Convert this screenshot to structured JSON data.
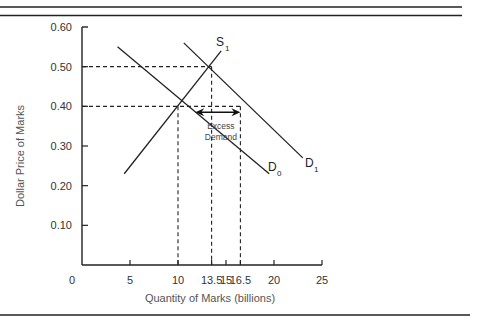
{
  "chart_data": {
    "type": "line",
    "title": "",
    "xlabel": "Quantity of Marks (billions)",
    "ylabel": "Dollar Price of Marks",
    "xlim": [
      0,
      25
    ],
    "ylim": [
      0,
      0.6
    ],
    "x_ticks": [
      "0",
      "5",
      "10",
      "13.5",
      "15",
      "16.5",
      "20",
      "25"
    ],
    "y_ticks": [
      "0.60",
      "0.50",
      "0.40",
      "0.30",
      "0.20",
      "0.10"
    ],
    "grid": false,
    "series": [
      {
        "name": "D0",
        "label_main": "D",
        "label_sub": "0",
        "kind": "demand",
        "points": [
          [
            3.7,
            0.55
          ],
          [
            19.5,
            0.23
          ]
        ]
      },
      {
        "name": "D1",
        "label_main": "D",
        "label_sub": "1",
        "kind": "demand",
        "points": [
          [
            10.6,
            0.56
          ],
          [
            23.0,
            0.27
          ]
        ]
      },
      {
        "name": "S1",
        "label_main": "S",
        "label_sub": "1",
        "kind": "supply",
        "points": [
          [
            4.4,
            0.23
          ],
          [
            14.5,
            0.54
          ]
        ]
      }
    ],
    "reference_lines": [
      {
        "type": "horizontal",
        "y": 0.5,
        "x_to": 13.5,
        "style": "dashed"
      },
      {
        "type": "horizontal",
        "y": 0.4,
        "x_to": 16.5,
        "style": "dashed"
      },
      {
        "type": "vertical",
        "x": 10,
        "y_to": 0.4,
        "style": "dashed"
      },
      {
        "type": "vertical",
        "x": 13.5,
        "y_to": 0.5,
        "style": "dashed"
      },
      {
        "type": "vertical",
        "x": 16.5,
        "y_to": 0.4,
        "style": "dashed"
      }
    ],
    "equilibria": [
      {
        "name": "initial",
        "x": 10,
        "y": 0.4
      },
      {
        "name": "new",
        "x": 13.5,
        "y": 0.5
      }
    ],
    "annotations": [
      {
        "text": "Excess Demand",
        "type": "double-arrow",
        "y": 0.385,
        "x_from": 11.8,
        "x_to": 16.5
      }
    ]
  },
  "labels": {
    "annot_line1": "Excess",
    "annot_line2": "Demand"
  }
}
